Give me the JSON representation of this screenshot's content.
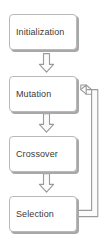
{
  "diagram": {
    "type": "flowchart",
    "background_color": "#ffffff",
    "node_fill": "#ffffff",
    "node_border_color": "#b9b9b9",
    "node_shadow_color": "#a8a8a8",
    "text_color": "#3a3a3a",
    "connector_color": "#9a9a9a",
    "connector_fill": "#fbfbfb",
    "nodes": [
      {
        "id": "initialization",
        "label": "Initialization",
        "order": 1
      },
      {
        "id": "mutation",
        "label": "Mutation",
        "order": 2
      },
      {
        "id": "crossover",
        "label": "Crossover",
        "order": 3
      },
      {
        "id": "selection",
        "label": "Selection",
        "order": 4
      }
    ],
    "connectors": [
      {
        "id": "init-to-mutation",
        "from": "initialization",
        "to": "mutation",
        "style": "block-arrow-down"
      },
      {
        "id": "mutation-to-crossover",
        "from": "mutation",
        "to": "crossover",
        "style": "block-arrow-down"
      },
      {
        "id": "crossover-to-selection",
        "from": "crossover",
        "to": "selection",
        "style": "block-arrow-down"
      },
      {
        "id": "selection-to-mutation-loop",
        "from": "selection",
        "to": "mutation",
        "style": "block-arrow-elbow-left"
      }
    ]
  }
}
